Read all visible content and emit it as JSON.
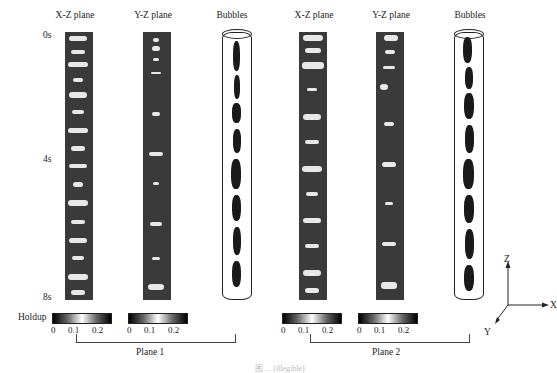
{
  "figure": {
    "column_titles": [
      "X-Z plane",
      "Y-Z plane",
      "Bubbles",
      "X-Z plane",
      "Y-Z plane",
      "Bubbles"
    ],
    "time_labels": [
      "0s",
      "4s",
      "8s"
    ],
    "colorbar": {
      "label": "Holdup",
      "ticks": [
        "0",
        "0.1",
        "0.2"
      ]
    },
    "groups": [
      "Plane 1",
      "Plane 2"
    ],
    "axes": {
      "z": "Z",
      "x": "X",
      "y": "Y"
    },
    "caption": "图 ... (illegible)"
  }
}
